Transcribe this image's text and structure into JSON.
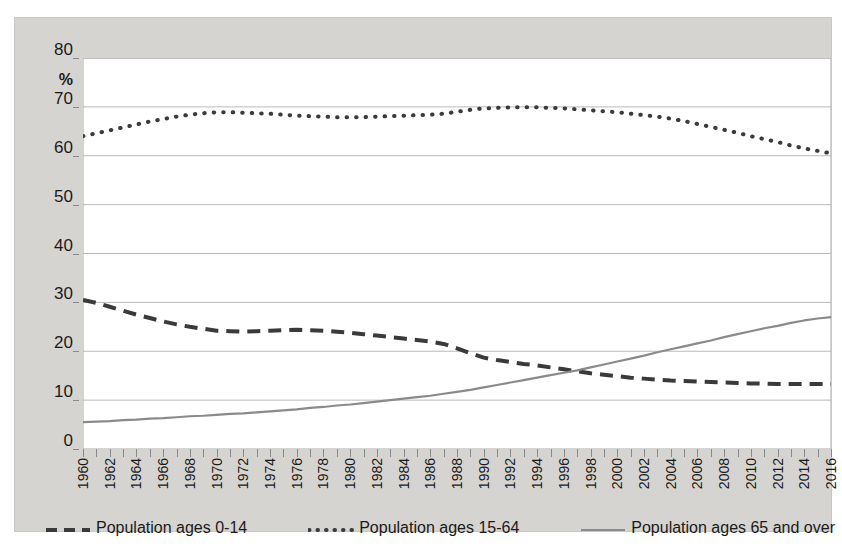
{
  "chart_data": {
    "type": "line",
    "title": "",
    "xlabel": "",
    "ylabel": "%",
    "ylim": [
      0,
      80
    ],
    "ytick_step": 10,
    "yticks": [
      "80",
      "70",
      "60",
      "50",
      "40",
      "30",
      "20",
      "10",
      "0"
    ],
    "xlim": [
      1960,
      2016
    ],
    "grid": "horizontal",
    "legend_position": "bottom",
    "x": [
      1960,
      1961,
      1962,
      1963,
      1964,
      1965,
      1966,
      1967,
      1968,
      1969,
      1970,
      1971,
      1972,
      1973,
      1974,
      1975,
      1976,
      1977,
      1978,
      1979,
      1980,
      1981,
      1982,
      1983,
      1984,
      1985,
      1986,
      1987,
      1988,
      1989,
      1990,
      1991,
      1992,
      1993,
      1994,
      1995,
      1996,
      1997,
      1998,
      1999,
      2000,
      2001,
      2002,
      2003,
      2004,
      2005,
      2006,
      2007,
      2008,
      2009,
      2010,
      2011,
      2012,
      2013,
      2014,
      2015,
      2016
    ],
    "xtick_labels": [
      "1960",
      "1962",
      "1964",
      "1966",
      "1968",
      "1970",
      "1972",
      "1974",
      "1976",
      "1978",
      "1980",
      "1982",
      "1984",
      "1986",
      "1988",
      "1990",
      "1992",
      "1994",
      "1996",
      "1998",
      "2000",
      "2002",
      "2004",
      "2006",
      "2008",
      "2010",
      "2012",
      "2014",
      "2016"
    ],
    "series": [
      {
        "name": "Population ages 0-14",
        "style": "dashed",
        "color": "#3a3a3a",
        "values": [
          30.5,
          29.9,
          29.1,
          28.3,
          27.5,
          26.8,
          26.1,
          25.5,
          25.0,
          24.6,
          24.2,
          24.1,
          24.0,
          24.1,
          24.2,
          24.3,
          24.4,
          24.3,
          24.2,
          24.0,
          23.8,
          23.5,
          23.2,
          22.9,
          22.6,
          22.3,
          22.0,
          21.5,
          20.6,
          19.6,
          18.7,
          18.2,
          17.8,
          17.4,
          17.1,
          16.7,
          16.3,
          15.9,
          15.5,
          15.2,
          14.9,
          14.6,
          14.4,
          14.2,
          14.0,
          13.9,
          13.8,
          13.7,
          13.6,
          13.5,
          13.4,
          13.4,
          13.3,
          13.3,
          13.3,
          13.3,
          13.3
        ]
      },
      {
        "name": "Population ages 15-64",
        "style": "dotted",
        "color": "#3a3a3a",
        "values": [
          64.0,
          64.6,
          65.2,
          65.8,
          66.4,
          67.0,
          67.5,
          68.0,
          68.4,
          68.7,
          68.9,
          68.9,
          68.8,
          68.7,
          68.6,
          68.4,
          68.2,
          68.1,
          68.0,
          67.9,
          67.9,
          67.9,
          68.0,
          68.1,
          68.2,
          68.3,
          68.4,
          68.6,
          69.0,
          69.4,
          69.7,
          69.8,
          69.9,
          69.9,
          69.9,
          69.8,
          69.7,
          69.5,
          69.3,
          69.1,
          68.9,
          68.6,
          68.3,
          68.0,
          67.6,
          67.1,
          66.5,
          65.9,
          65.3,
          64.7,
          64.0,
          63.4,
          62.8,
          62.1,
          61.5,
          61.0,
          60.5
        ]
      },
      {
        "name": "Population ages 65 and over",
        "style": "solid",
        "color": "#8a8a8a",
        "values": [
          5.5,
          5.6,
          5.7,
          5.9,
          6.0,
          6.2,
          6.3,
          6.5,
          6.7,
          6.8,
          7.0,
          7.2,
          7.3,
          7.5,
          7.7,
          7.9,
          8.1,
          8.4,
          8.6,
          8.9,
          9.1,
          9.4,
          9.7,
          10.0,
          10.3,
          10.6,
          10.9,
          11.3,
          11.7,
          12.1,
          12.6,
          13.1,
          13.6,
          14.1,
          14.6,
          15.1,
          15.6,
          16.1,
          16.7,
          17.3,
          17.9,
          18.5,
          19.1,
          19.8,
          20.4,
          21.0,
          21.6,
          22.2,
          22.9,
          23.5,
          24.1,
          24.7,
          25.2,
          25.8,
          26.3,
          26.7,
          27.0
        ]
      }
    ]
  },
  "axis": {
    "y_unit": "%"
  },
  "legend": {
    "items": [
      {
        "label": "Population ages 0-14",
        "style": "dashed",
        "color": "#3a3a3a"
      },
      {
        "label": "Population ages 15-64",
        "style": "dotted",
        "color": "#3a3a3a"
      },
      {
        "label": "Population ages 65 and over",
        "style": "solid",
        "color": "#8a8a8a"
      }
    ]
  },
  "colors": {
    "frame_background": "#d6d4d1",
    "plot_background": "#ffffff",
    "gridline": "#a8a8a8",
    "axis_line": "#8a8a8a",
    "text": "#1a1a1a"
  }
}
